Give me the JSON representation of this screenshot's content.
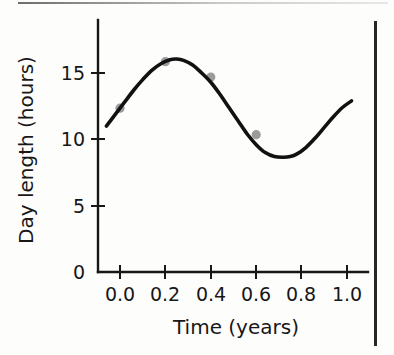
{
  "figure": {
    "name": "day-length-vs-time-plot",
    "background_color": "#fdfdfc",
    "ink_color": "#171717",
    "curve_color": "#111111",
    "marker_color": "#8a8a8a"
  },
  "decorations": {
    "top_rule_label": "page-top-rule",
    "column_rule_label": "page-column-rule"
  },
  "chart_data": {
    "type": "line",
    "title": "",
    "subtitle": "",
    "xlabel": "Time (years)",
    "ylabel": "Day length (hours)",
    "xlim": [
      -0.06,
      1.03
    ],
    "ylim": [
      0,
      17.6
    ],
    "xticks": [
      0.0,
      0.2,
      0.4,
      0.6,
      0.8,
      1.0
    ],
    "xtick_labels": [
      "0.0",
      "0.2",
      "0.4",
      "0.6",
      "0.8",
      "1.0"
    ],
    "yticks": [
      0,
      5,
      10,
      15
    ],
    "ytick_labels": [
      "0",
      "5",
      "10",
      "15"
    ],
    "grid": false,
    "legend": null,
    "annotations": [],
    "series": [
      {
        "name": "fitted sinusoid",
        "kind": "line",
        "style": "solid",
        "color": "#111111",
        "model": "12.35 + 3.7 * sin(2*pi*(t - 0.0))",
        "x": [
          -0.06,
          -0.02,
          0.02,
          0.06,
          0.1,
          0.14,
          0.18,
          0.22,
          0.25,
          0.28,
          0.32,
          0.36,
          0.4,
          0.44,
          0.48,
          0.52,
          0.56,
          0.6,
          0.64,
          0.68,
          0.72,
          0.75,
          0.78,
          0.82,
          0.86,
          0.9,
          0.94,
          0.98,
          1.02
        ],
        "y": [
          11.0,
          11.9,
          12.8,
          13.7,
          14.5,
          15.2,
          15.7,
          16.0,
          16.05,
          15.95,
          15.6,
          15.0,
          14.3,
          13.4,
          12.4,
          11.4,
          10.4,
          9.6,
          9.0,
          8.7,
          8.65,
          8.7,
          8.9,
          9.4,
          10.1,
          10.9,
          11.7,
          12.4,
          12.9
        ]
      },
      {
        "name": "measured day lengths",
        "kind": "scatter",
        "color": "#8a8a8a",
        "x": [
          0.0,
          0.2,
          0.4,
          0.6
        ],
        "y": [
          12.35,
          15.85,
          14.7,
          10.35
        ]
      }
    ]
  }
}
